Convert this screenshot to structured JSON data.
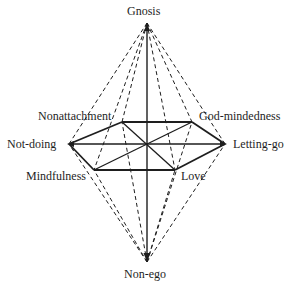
{
  "diagram": {
    "apex_top": {
      "label": "Gnosis",
      "x": 147,
      "y": 23
    },
    "apex_bottom": {
      "label": "Non-ego",
      "x": 147,
      "y": 262
    },
    "center": {
      "x": 147,
      "y": 144
    },
    "hexagon_vertices": [
      {
        "id": "nonattachment",
        "label": "Nonattachment",
        "x": 122,
        "y": 122
      },
      {
        "id": "god-mindedness",
        "label": "God-mindedness",
        "x": 192,
        "y": 122
      },
      {
        "id": "letting-go",
        "label": "Letting-go",
        "x": 225,
        "y": 144
      },
      {
        "id": "love",
        "label": "Love",
        "x": 175,
        "y": 170
      },
      {
        "id": "mindfulness",
        "label": "Mindfulness",
        "x": 94,
        "y": 170
      },
      {
        "id": "not-doing",
        "label": "Not-doing",
        "x": 69,
        "y": 144
      }
    ],
    "line_color": "#1e1e1e",
    "background": "#ffffff"
  },
  "labels": {
    "gnosis": "Gnosis",
    "non_ego": "Non-ego",
    "nonattachment": "Nonattachment",
    "god_mindedness": "God-mindedness",
    "not_doing": "Not-doing",
    "letting_go": "Letting-go",
    "mindfulness": "Mindfulness",
    "love": "Love"
  }
}
